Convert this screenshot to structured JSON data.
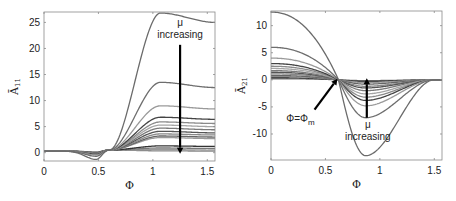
{
  "chart_data": [
    {
      "type": "line",
      "title": "",
      "xlabel": "Φ",
      "ylabel": "Ā11",
      "ylabel_main": "Ā",
      "ylabel_sub": "11",
      "xlim": [
        0,
        1.5708
      ],
      "ylim": [
        -1.6,
        27
      ],
      "grid": false,
      "legend": null,
      "xticks": [
        0,
        0.5,
        1,
        1.5
      ],
      "xtick_labels": [
        "0",
        "0.5",
        "1",
        "1.5"
      ],
      "yticks": [
        0,
        5,
        10,
        15,
        20,
        25
      ],
      "ytick_labels": [
        "0",
        "5",
        "10",
        "15",
        "20",
        "25"
      ],
      "box": {
        "x0": 44,
        "y0": 12,
        "x1": 215,
        "y1": 161
      },
      "annotations": [
        {
          "text": "μ",
          "x": 1.25,
          "y": 24.3
        },
        {
          "text": "increasing",
          "x": 1.25,
          "y": 22.0
        },
        {
          "type": "arrow",
          "from": [
            1.25,
            20.7
          ],
          "to": [
            1.25,
            -0.2
          ],
          "label": "μ increasing (down)"
        }
      ],
      "series": [
        {
          "name": "curve1",
          "dip": -1.3,
          "peak": 26.8,
          "end": 25.0,
          "color": "#6b6b6b"
        },
        {
          "name": "curve2",
          "dip": -0.7,
          "peak": 13.5,
          "end": 12.5,
          "color": "#6e6e6e"
        },
        {
          "name": "curve3",
          "dip": -0.45,
          "peak": 9.0,
          "end": 8.4,
          "color": "#9a9a9a"
        },
        {
          "name": "curve4",
          "dip": -0.3,
          "peak": 6.8,
          "end": 6.4,
          "color": "#444444"
        },
        {
          "name": "curve5",
          "dip": -0.25,
          "peak": 5.9,
          "end": 5.6,
          "color": "#8a8a8a"
        },
        {
          "name": "curve6",
          "dip": -0.2,
          "peak": 5.3,
          "end": 5.0,
          "color": "#a5a5a5"
        },
        {
          "name": "curve7",
          "dip": -0.15,
          "peak": 4.7,
          "end": 4.4,
          "color": "#7a7a7a"
        },
        {
          "name": "curve8",
          "dip": -0.1,
          "peak": 4.1,
          "end": 3.8,
          "color": "#555555"
        },
        {
          "name": "curve9",
          "dip": -0.08,
          "peak": 3.6,
          "end": 3.4,
          "color": "#888888"
        },
        {
          "name": "curve10",
          "dip": -0.05,
          "peak": 3.2,
          "end": 3.0,
          "color": "#666666"
        },
        {
          "name": "curve11",
          "dip": -0.04,
          "peak": 2.9,
          "end": 2.7,
          "color": "#999999"
        },
        {
          "name": "curve12",
          "dip": 0.0,
          "peak": 1.3,
          "end": 1.2,
          "color": "#333333"
        },
        {
          "name": "curve13",
          "dip": 0.05,
          "peak": 0.9,
          "end": 0.8,
          "color": "#777777"
        },
        {
          "name": "curve14",
          "dip": 0.1,
          "peak": 0.6,
          "end": 0.5,
          "color": "#999999"
        },
        {
          "name": "curve15",
          "dip": 0.15,
          "peak": 0.35,
          "end": 0.3,
          "color": "#888888"
        }
      ],
      "shape": {
        "flat_value": 0.3,
        "dip_at": 0.48,
        "cross_at": 0.6,
        "cross_value": 0.5,
        "peak_at": 1.07
      }
    },
    {
      "type": "line",
      "title": "",
      "xlabel": "Φ",
      "ylabel": "Ā21",
      "ylabel_main": "Ā",
      "ylabel_sub": "21",
      "xlim": [
        0,
        1.5708
      ],
      "ylim": [
        -14.8,
        12.7
      ],
      "grid": false,
      "legend": null,
      "xticks": [
        0,
        0.5,
        1,
        1.5
      ],
      "xtick_labels": [
        "0",
        "0.5",
        "1",
        "1.5"
      ],
      "yticks": [
        -10,
        -5,
        0,
        5,
        10
      ],
      "ytick_labels": [
        "-10",
        "-5",
        "0",
        "5",
        "10"
      ],
      "box": {
        "x0": 271,
        "y0": 11,
        "x1": 442,
        "y1": 160
      },
      "annotations": [
        {
          "type": "arrow",
          "from": [
            0.4,
            -5.5
          ],
          "to": [
            0.61,
            0.2
          ],
          "label": "Φ=Φm"
        },
        {
          "text": "Φ=Φ",
          "sub": "m",
          "x": 0.27,
          "y": -7.8
        },
        {
          "type": "arrow",
          "from": [
            0.88,
            -7.0
          ],
          "to": [
            0.88,
            0.3
          ],
          "label": "μ increasing (up)"
        },
        {
          "text": "μ",
          "x": 0.89,
          "y": -8.9
        },
        {
          "text": "increasing",
          "x": 0.89,
          "y": -11.1
        }
      ],
      "series": [
        {
          "name": "curve1",
          "start": 12.5,
          "min": -14.0,
          "color": "#6b6b6b"
        },
        {
          "name": "curve2",
          "start": 6.0,
          "min": -7.0,
          "color": "#6e6e6e"
        },
        {
          "name": "curve3",
          "start": 4.0,
          "min": -4.8,
          "color": "#9a9a9a"
        },
        {
          "name": "curve4",
          "start": 3.0,
          "min": -3.8,
          "color": "#444444"
        },
        {
          "name": "curve5",
          "start": 2.5,
          "min": -3.2,
          "color": "#8a8a8a"
        },
        {
          "name": "curve6",
          "start": 2.1,
          "min": -2.6,
          "color": "#a5a5a5"
        },
        {
          "name": "curve7",
          "start": 1.7,
          "min": -2.0,
          "color": "#7a7a7a"
        },
        {
          "name": "curve8",
          "start": 1.4,
          "min": -1.5,
          "color": "#555555"
        },
        {
          "name": "curve9",
          "start": 1.1,
          "min": -1.2,
          "color": "#888888"
        },
        {
          "name": "curve10",
          "start": 0.8,
          "min": -0.8,
          "color": "#666666"
        },
        {
          "name": "curve11",
          "start": 0.6,
          "min": -0.5,
          "color": "#999999"
        },
        {
          "name": "curve12",
          "start": 0.4,
          "min": -0.3,
          "color": "#333333"
        },
        {
          "name": "curve13",
          "start": 0.2,
          "min": -0.15,
          "color": "#777777"
        }
      ],
      "shape": {
        "cross_at": 0.62,
        "min_at": 0.87,
        "zero_after": 1.5
      }
    }
  ]
}
